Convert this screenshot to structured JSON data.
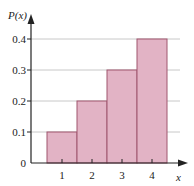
{
  "chart_data": {
    "type": "bar",
    "title": "",
    "xlabel": "x",
    "ylabel": "P(x)",
    "categories": [
      "1",
      "2",
      "3",
      "4"
    ],
    "values": [
      0.1,
      0.2,
      0.3,
      0.4
    ],
    "ylim": [
      0,
      0.4
    ],
    "yticks": [
      "0",
      "0.1",
      "0.2",
      "0.3",
      "0.4"
    ],
    "xticks": [
      "1",
      "2",
      "3",
      "4"
    ],
    "grid": "horizontal",
    "legend": "none",
    "bar_color": "#e2b3c5",
    "bar_edge_color": "#a0566f",
    "grid_color": "#c8c8c8",
    "axis_color": "#222222"
  }
}
